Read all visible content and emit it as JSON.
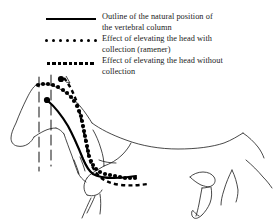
{
  "figure": {
    "title": "Outline of the natural position of the vertebral column",
    "background_color": "#ffffff",
    "ink_color": "#000000"
  },
  "legend": {
    "items": [
      {
        "style": "solid",
        "icon": "solid-line-icon",
        "label": "Outline of the natural position of\nthe vertebral column"
      },
      {
        "style": "dotted",
        "icon": "dotted-line-icon",
        "label": "Effect of elevating the head with\ncollection (ramener)"
      },
      {
        "style": "dashed",
        "icon": "dashed-line-icon",
        "label": "Effect of elevating the head without\ncollection"
      }
    ],
    "dotted_sample_dot_count": 8,
    "dashed_sample_dash_count": 9
  },
  "diagram_parts": {
    "horse_outline": "horse-body-outline",
    "vertical_reference_lines": 2,
    "bones": [
      "pelvis",
      "femur",
      "scapula",
      "humerus",
      "ribs"
    ],
    "curves": [
      "natural-vertebral-column-solid",
      "elevated-with-collection-dotted",
      "elevated-without-collection-dashed"
    ]
  }
}
